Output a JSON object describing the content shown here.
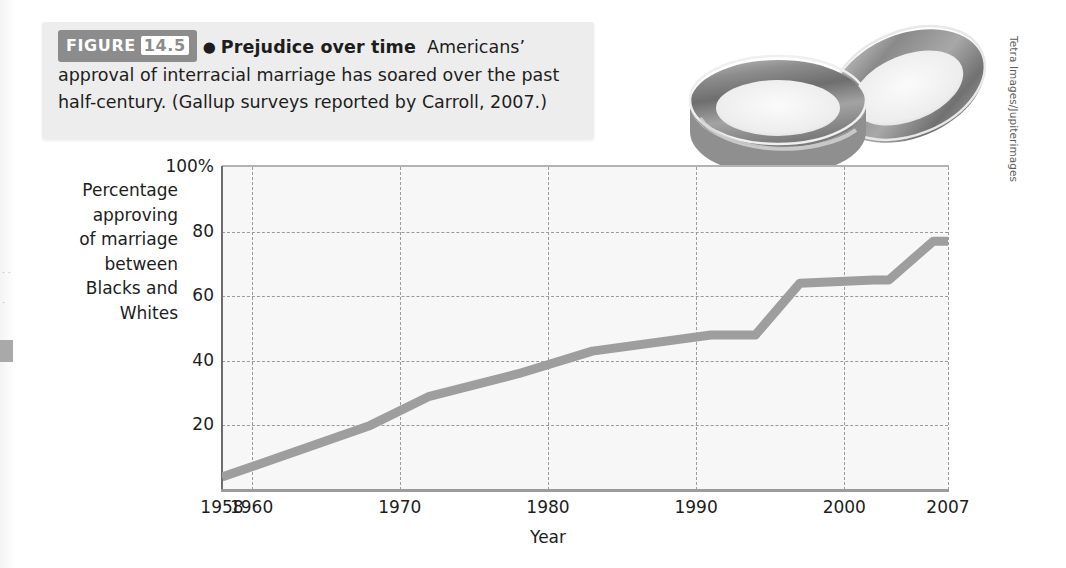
{
  "figure": {
    "badge_label": "FIGURE",
    "badge_number": "14.5",
    "bullet": "●",
    "title": "Prejudice over time",
    "body": "Americans’ approval of interracial marriage has soared over the past half-century. (Gallup surveys reported by Carroll, 2007.)",
    "photo_credit": "Tetra Images/Jupiterimages",
    "photo_alt": "two-wedding-rings-photo",
    "edge_marks": "· · ·"
  },
  "chart_data": {
    "type": "line",
    "title": "Prejudice over time",
    "xlabel": "Year",
    "ylabel": "Percentage approving of marriage between Blacks and Whites",
    "ylabel_lines": [
      "Percentage",
      "approving",
      "of marriage",
      "between",
      "Blacks and",
      "Whites"
    ],
    "xlim": [
      1958,
      2007
    ],
    "ylim": [
      0,
      100
    ],
    "yticks": [
      20,
      40,
      60,
      80,
      100
    ],
    "ytick_labels": [
      "20",
      "40",
      "60",
      "80",
      "100%"
    ],
    "xticks": [
      1958,
      1960,
      1970,
      1980,
      1990,
      2000,
      2007
    ],
    "xtick_labels": [
      "1958",
      "1960",
      "1970",
      "1980",
      "1990",
      "2000",
      "2007"
    ],
    "grid": true,
    "grid_style": "dashed",
    "legend": "none",
    "series": [
      {
        "name": "Approval of marriage between Blacks and Whites",
        "color": "#9e9e9e",
        "x": [
          1958,
          1968,
          1972,
          1978,
          1983,
          1991,
          1994,
          1997,
          2002,
          2003,
          2006,
          2007
        ],
        "values": [
          4,
          20,
          29,
          36,
          43,
          48,
          48,
          64,
          65,
          65,
          77,
          77
        ]
      }
    ],
    "colors": {
      "line": "#9e9e9e",
      "plot_background": "#f7f7f7",
      "gridline": "#9a9a9a",
      "axis": "#6d6d6d",
      "text": "#1d1d1d",
      "caption_background": "#ededed",
      "badge_background": "#8c8c8c"
    }
  }
}
